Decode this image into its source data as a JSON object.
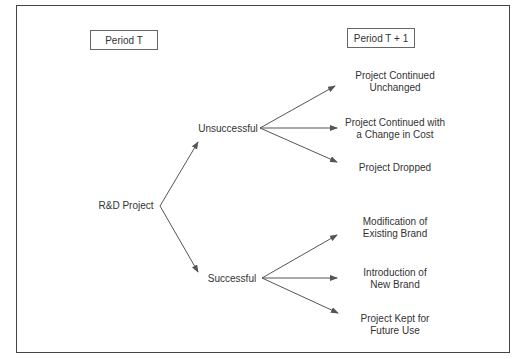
{
  "caption": "Figure ... Decision Tree for R&D Project Outcomes",
  "periods": {
    "left": "Period T",
    "right": "Period T + 1"
  },
  "root": "R&D Project",
  "branches": [
    {
      "label": "Unsuccessful",
      "outcomes": [
        {
          "line1": "Project Continued",
          "line2": "Unchanged"
        },
        {
          "line1": "Project Continued with",
          "line2": "a Change in Cost"
        },
        {
          "line1": "Project Dropped",
          "line2": ""
        }
      ]
    },
    {
      "label": "Successful",
      "outcomes": [
        {
          "line1": "Modification of",
          "line2": "Existing Brand"
        },
        {
          "line1": "Introduction of",
          "line2": "New Brand"
        },
        {
          "line1": "Project Kept for",
          "line2": "Future Use"
        }
      ]
    }
  ],
  "colors": {
    "line": "#555555",
    "text": "#333333",
    "frame": "#444444"
  }
}
